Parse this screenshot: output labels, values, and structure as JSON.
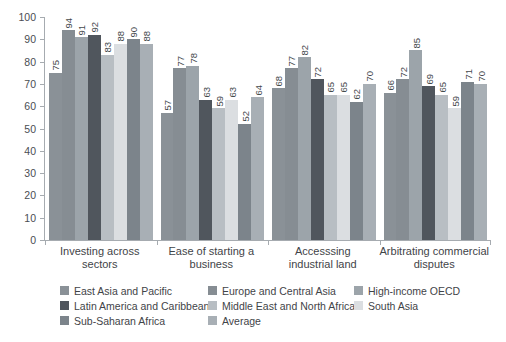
{
  "chart_data": {
    "type": "bar",
    "title": "",
    "ylim": [
      0,
      100
    ],
    "yticks": [
      0,
      10,
      20,
      30,
      40,
      50,
      60,
      70,
      80,
      90,
      100
    ],
    "grid": false,
    "legend_position": "bottom",
    "categories": [
      "Investing across\nsectors",
      "Ease of starting a\nbusiness",
      "Accesssing\nindustrial land",
      "Arbitrating commercial\ndisputes"
    ],
    "series": [
      {
        "name": "East Asia and Pacific",
        "color": "#8a9197",
        "values": [
          75,
          57,
          68,
          66
        ]
      },
      {
        "name": "Europe and Central Asia",
        "color": "#868d93",
        "values": [
          94,
          77,
          77,
          72
        ]
      },
      {
        "name": "High-income OECD",
        "color": "#9ca4aa",
        "values": [
          91,
          78,
          82,
          85
        ]
      },
      {
        "name": "Latin America and Caribbean",
        "color": "#50565d",
        "values": [
          92,
          63,
          72,
          69
        ]
      },
      {
        "name": "Middle East and North Africa",
        "color": "#b8bec3",
        "values": [
          83,
          59,
          65,
          65
        ]
      },
      {
        "name": "South Asia",
        "color": "#dbdee1",
        "values": [
          88,
          63,
          65,
          59
        ]
      },
      {
        "name": "Sub-Saharan Africa",
        "color": "#7c848b",
        "values": [
          90,
          52,
          62,
          71
        ]
      },
      {
        "name": "Average",
        "color": "#a8afb5",
        "values": [
          88,
          64,
          70,
          70
        ]
      }
    ]
  },
  "style": {
    "axis_color": "#a6abb0",
    "text_color": "#45494d",
    "background": "#ffffff"
  }
}
